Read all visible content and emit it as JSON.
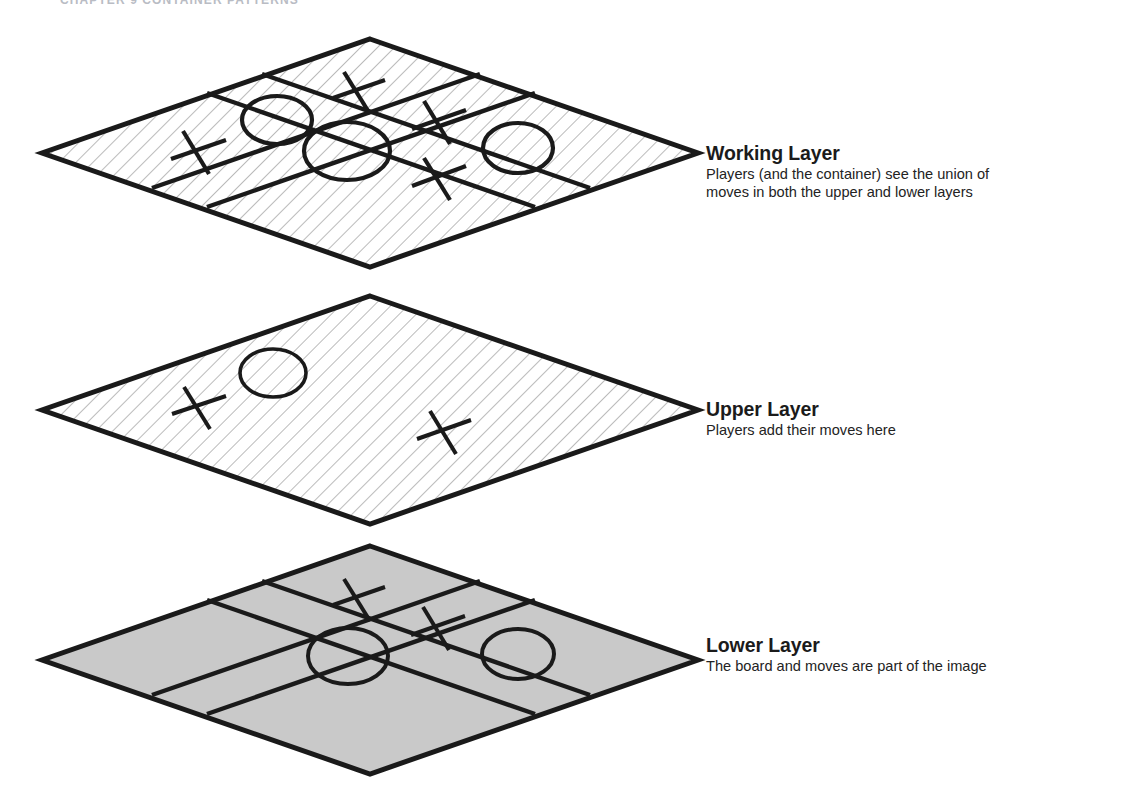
{
  "page": {
    "running_header": "CHAPTER 9   CONTAINER PATTERNS",
    "background_color": "#ffffff",
    "width": 1132,
    "height": 800
  },
  "diagram": {
    "type": "layered-isometric-diagram",
    "ink_color": "#1a1a1a",
    "hatch_color": "#9a9a9a",
    "lower_fill_color": "#c9c9c9",
    "layers": [
      {
        "id": "working",
        "title": "Working Layer",
        "description": "Players (and the container) see the union of\nmoves in both the upper and lower layers",
        "description_lines": [
          "Players (and the container) see the union of",
          "moves in both the upper and lower layers"
        ],
        "fill_style": "hatched",
        "fill_color": "#ffffff",
        "has_grid": true,
        "center": {
          "x": 370,
          "y": 153
        },
        "half_width": 328,
        "half_height": 114,
        "marks": [
          {
            "symbol": "X",
            "cell": "top-center",
            "cx": 357,
            "cy": 92
          },
          {
            "symbol": "O",
            "cell": "top-left",
            "cx": 277,
            "cy": 120
          },
          {
            "symbol": "X",
            "cell": "top-right",
            "cx": 438,
            "cy": 122
          },
          {
            "symbol": "X",
            "cell": "middle-left",
            "cx": 197,
            "cy": 152
          },
          {
            "symbol": "O",
            "cell": "middle-center",
            "cx": 347,
            "cy": 150
          },
          {
            "symbol": "O",
            "cell": "middle-right",
            "cx": 518,
            "cy": 148
          },
          {
            "symbol": "X",
            "cell": "bottom-center",
            "cx": 438,
            "cy": 178
          }
        ]
      },
      {
        "id": "upper",
        "title": "Upper Layer",
        "description": "Players add their moves here",
        "description_lines": [
          "Players add their moves here"
        ],
        "fill_style": "hatched",
        "fill_color": "#ffffff",
        "has_grid": false,
        "center": {
          "x": 370,
          "y": 410
        },
        "half_width": 328,
        "half_height": 114,
        "marks": [
          {
            "symbol": "X",
            "cell": "middle-left",
            "cx": 198,
            "cy": 407
          },
          {
            "symbol": "O",
            "cell": "top-left",
            "cx": 273,
            "cy": 373
          },
          {
            "symbol": "X",
            "cell": "middle-right",
            "cx": 444,
            "cy": 432
          }
        ]
      },
      {
        "id": "lower",
        "title": "Lower Layer",
        "description": "The board and moves are part of the image",
        "description_lines": [
          "The board and moves are part of the image"
        ],
        "fill_style": "solid",
        "fill_color": "#c9c9c9",
        "has_grid": true,
        "center": {
          "x": 370,
          "y": 660
        },
        "half_width": 328,
        "half_height": 114,
        "marks": [
          {
            "symbol": "X",
            "cell": "top-center",
            "cx": 357,
            "cy": 598
          },
          {
            "symbol": "X",
            "cell": "top-right",
            "cx": 437,
            "cy": 628
          },
          {
            "symbol": "O",
            "cell": "middle-center",
            "cx": 348,
            "cy": 655
          },
          {
            "symbol": "O",
            "cell": "middle-right",
            "cx": 518,
            "cy": 653
          }
        ]
      }
    ]
  }
}
